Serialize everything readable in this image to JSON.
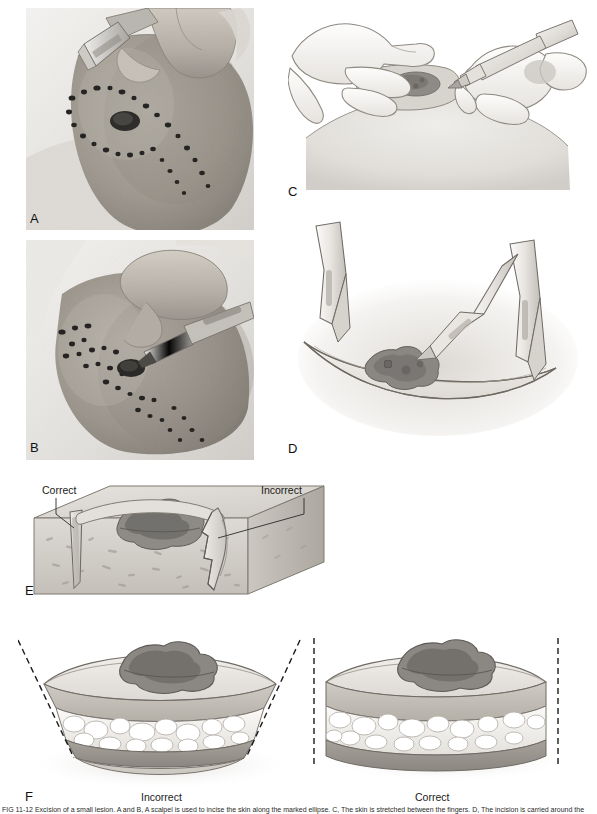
{
  "figure": {
    "caption": "FIG 11-12 Excision of a small lesion. A and B, A scalpel is used to incise the skin along the marked ellipse. C, The skin is stretched between the fingers. D, The incision is carried around the ellipse. E, The blade is held perpendicular to the skin surface. F, Correct and incorrect specimen shapes.",
    "background": "#ffffff"
  },
  "panels": [
    {
      "id": "A",
      "label": "A",
      "type": "photograph",
      "description": "Clinical photograph: gloved fingers stretch the skin while a scalpel blade begins the incision at the apex of an ink-marked elliptical outline surrounding a pigmented lesion."
    },
    {
      "id": "B",
      "label": "B",
      "type": "photograph",
      "description": "Clinical photograph: the scalpel is drawn along the marked ellipse, incising the skin around the pigmented lesion."
    },
    {
      "id": "C",
      "label": "C",
      "type": "illustration",
      "description": "Line drawing: one hand stretches and stabilizes the skin with spread fingers while the other hand holds the scalpel like a pen to begin the incision."
    },
    {
      "id": "D",
      "label": "D",
      "type": "illustration",
      "description": "Line drawing: elliptical skin incision outline containing the lesion, with three scalpel blades indicating the direction of the cut."
    },
    {
      "id": "E",
      "label": "E",
      "type": "illustration",
      "description": "Three dimensional block of skin and subcutaneous tissue showing a smooth perpendicular incision on one side and a ragged stepped incision on the other.",
      "annotations": [
        {
          "name": "correct",
          "text": "Correct",
          "side": "left"
        },
        {
          "name": "incorrect",
          "text": "Incorrect",
          "side": "right"
        }
      ]
    },
    {
      "id": "F",
      "label": "F",
      "type": "illustration",
      "description": "Two excised specimens in cross section. The left specimen has bevelled converging walls; the right specimen has vertical walls extending to the subcutaneous fat.",
      "sublabels": [
        {
          "name": "incorrect-specimen",
          "text": "Incorrect",
          "side": "left"
        },
        {
          "name": "correct-specimen",
          "text": "Correct",
          "side": "right"
        }
      ]
    }
  ],
  "colors": {
    "ink": "#1a1a1a",
    "skin_light": "#e9e6e1",
    "skin_mid": "#cfcac3",
    "skin_dark": "#a9a39b",
    "lesion": "#7d7a76",
    "lesion_dark": "#5e5b58",
    "fat": "#f2f0ec",
    "dermis": "#b8b2aa",
    "photo_bg": "#b9b5ae",
    "outline": "#6f6a64",
    "dashed": "#1a1a1a"
  }
}
